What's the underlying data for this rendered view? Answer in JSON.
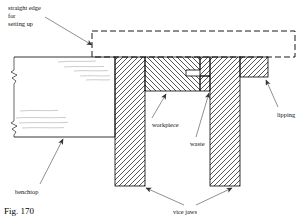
{
  "figure": {
    "number_label": "Fig. 170",
    "caption_parts": [
      "straight edge",
      "for",
      "setting up"
    ],
    "type": "technical-cross-section-diagram"
  },
  "labels": {
    "straight_edge": "straight edge\nfor\nsetting up",
    "straight_edge_line1": "straight edge",
    "straight_edge_line2": "for",
    "straight_edge_line3": "setting up",
    "workpiece": "workpiece",
    "waste": "waste",
    "lipping": "lipping",
    "benchtop": "benchtop",
    "vice_jaws": "vice jaws"
  },
  "parts": [
    {
      "name": "straight-edge",
      "style": "dashed-outline",
      "hatched": false
    },
    {
      "name": "benchtop",
      "style": "solid-outline-with-grain",
      "hatched": false
    },
    {
      "name": "left-vice-jaw",
      "style": "hatched",
      "hatch_dir": "backslash"
    },
    {
      "name": "workpiece",
      "style": "hatched",
      "hatch_dir": "forwardslash"
    },
    {
      "name": "waste",
      "style": "hatched",
      "hatch_dir": "backslash"
    },
    {
      "name": "right-vice-jaw",
      "style": "hatched",
      "hatch_dir": "backslash"
    },
    {
      "name": "lipping",
      "style": "hatched",
      "hatch_dir": "backslash"
    }
  ],
  "colors": {
    "line": "#000000",
    "hatch": "#222222",
    "grain": "#9a9a9a",
    "background": "#ffffff",
    "leader": "#444444"
  }
}
